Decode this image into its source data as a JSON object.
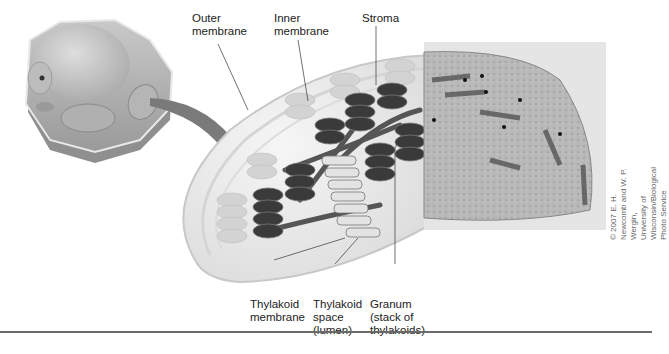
{
  "figure": {
    "labels": {
      "outer_membrane": "Outer\nmembrane",
      "inner_membrane": "Inner\nmembrane",
      "stroma": "Stroma",
      "thylakoid_membrane": "Thylakoid\nmembrane",
      "thylakoid_space": "Thylakoid\nspace\n(lumen)",
      "granum": "Granum\n(stack of\nthylakoids)"
    },
    "credit": "© 2007 E. H. Newcomb and W. P. Wergin,\nUniversity of Wisconsin/Biological Photo Service",
    "panels": [
      {
        "name": "plant-cell-illustration",
        "description": "Cutaway plant cell with chloroplast highlighted"
      },
      {
        "name": "chloroplast-cutaway-illustration",
        "description": "Chloroplast showing membranes, grana, stroma"
      },
      {
        "name": "electron-micrograph",
        "description": "TEM micrograph of chloroplast"
      }
    ],
    "colors": {
      "granum": "#3a3a3a",
      "membrane": "#d8d8d8",
      "arrow": "#7a7a7a",
      "rule": "#6a6a6a"
    }
  }
}
